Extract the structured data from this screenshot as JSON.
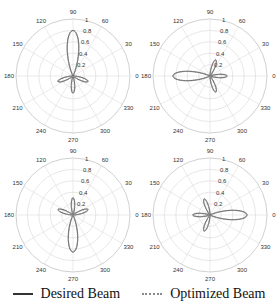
{
  "chart_data": [
    {
      "type": "polar",
      "title": "",
      "panel": "top-left",
      "angle_ticks": [
        "0",
        "30",
        "60",
        "90",
        "120",
        "150",
        "180",
        "210",
        "240",
        "270",
        "300",
        "330"
      ],
      "radial_ticks": [
        "0.2",
        "0.4",
        "0.6",
        "0.8",
        "1"
      ],
      "rlim": [
        0,
        1
      ],
      "grid": true,
      "main_lobe_deg": 90,
      "main_lobe_peak": 0.8,
      "side_lobes": [
        {
          "deg": 200,
          "peak": 0.28
        },
        {
          "deg": 270,
          "peak": 0.3
        },
        {
          "deg": 340,
          "peak": 0.28
        }
      ],
      "series": [
        {
          "name": "Desired Beam",
          "style": "solid"
        },
        {
          "name": "Optimized Beam",
          "style": "dotted"
        }
      ]
    },
    {
      "type": "polar",
      "title": "",
      "panel": "top-right",
      "angle_ticks": [
        "0",
        "30",
        "60",
        "90",
        "120",
        "150",
        "180",
        "210",
        "240",
        "270",
        "300",
        "330"
      ],
      "radial_ticks": [
        "0.2",
        "0.4",
        "0.6",
        "0.8",
        "1"
      ],
      "rlim": [
        0,
        1
      ],
      "grid": true,
      "main_lobe_deg": 180,
      "main_lobe_peak": 0.65,
      "side_lobes": [
        {
          "deg": 70,
          "peak": 0.3
        },
        {
          "deg": 0,
          "peak": 0.3
        },
        {
          "deg": 290,
          "peak": 0.3
        }
      ],
      "series": [
        {
          "name": "Desired Beam",
          "style": "solid"
        },
        {
          "name": "Optimized Beam",
          "style": "dotted"
        }
      ]
    },
    {
      "type": "polar",
      "title": "",
      "panel": "bottom-left",
      "angle_ticks": [
        "0",
        "30",
        "60",
        "90",
        "120",
        "150",
        "180",
        "210",
        "240",
        "270",
        "300",
        "330"
      ],
      "radial_ticks": [
        "0.2",
        "0.4",
        "0.6",
        "0.8",
        "1"
      ],
      "rlim": [
        0,
        1
      ],
      "grid": true,
      "main_lobe_deg": 270,
      "main_lobe_peak": 0.65,
      "side_lobes": [
        {
          "deg": 20,
          "peak": 0.28
        },
        {
          "deg": 90,
          "peak": 0.3
        },
        {
          "deg": 160,
          "peak": 0.28
        }
      ],
      "series": [
        {
          "name": "Desired Beam",
          "style": "solid"
        },
        {
          "name": "Optimized Beam",
          "style": "dotted"
        }
      ]
    },
    {
      "type": "polar",
      "title": "",
      "panel": "bottom-right",
      "angle_ticks": [
        "0",
        "30",
        "60",
        "90",
        "120",
        "150",
        "180",
        "210",
        "240",
        "270",
        "300",
        "330"
      ],
      "radial_ticks": [
        "0.2",
        "0.4",
        "0.6",
        "0.8",
        "1"
      ],
      "rlim": [
        0,
        1
      ],
      "grid": true,
      "main_lobe_deg": 0,
      "main_lobe_peak": 0.65,
      "side_lobes": [
        {
          "deg": 110,
          "peak": 0.3
        },
        {
          "deg": 180,
          "peak": 0.3
        },
        {
          "deg": 250,
          "peak": 0.3
        }
      ],
      "series": [
        {
          "name": "Desired Beam",
          "style": "solid"
        },
        {
          "name": "Optimized Beam",
          "style": "dotted"
        }
      ]
    }
  ],
  "legend": {
    "desired_label": "Desired Beam",
    "optimized_label": "Optimized Beam"
  },
  "colors": {
    "desired": "#333333",
    "optimized": "#8a8a8a",
    "grid": "#d6d6d6",
    "outer": "#b0b0b0"
  }
}
